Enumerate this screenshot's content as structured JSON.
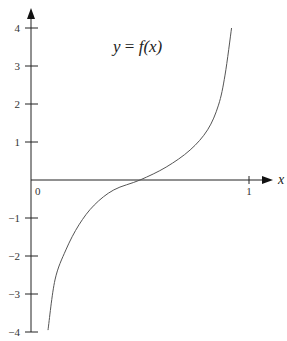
{
  "chart_data": {
    "type": "line",
    "title": "y = f(x)",
    "title_parts": {
      "y": "y",
      "eq": " = ",
      "f": "f",
      "arg": "(x)"
    },
    "xlabel": "x",
    "ylabel": "",
    "xlim": [
      0,
      1.05
    ],
    "ylim": [
      -4,
      4
    ],
    "grid": false,
    "legend": "none",
    "x_ticks": [
      {
        "value": 1,
        "label": "1"
      }
    ],
    "origin_label": "0",
    "y_ticks": [
      {
        "value": 4,
        "label": "4"
      },
      {
        "value": 3,
        "label": "3"
      },
      {
        "value": 2,
        "label": "2"
      },
      {
        "value": 1,
        "label": "1"
      },
      {
        "value": -1,
        "label": "−1"
      },
      {
        "value": -2,
        "label": "−2"
      },
      {
        "value": -3,
        "label": "−3"
      },
      {
        "value": -4,
        "label": "−4"
      }
    ],
    "series": [
      {
        "name": "f(x)",
        "x": [
          0.078,
          0.11,
          0.16,
          0.22,
          0.29,
          0.38,
          0.5,
          0.62,
          0.73,
          0.81,
          0.86,
          0.89,
          0.92
        ],
        "y": [
          -3.95,
          -2.63,
          -1.84,
          -1.18,
          -0.66,
          -0.26,
          0.0,
          0.34,
          0.79,
          1.32,
          1.97,
          2.76,
          4.0
        ]
      }
    ]
  },
  "colors": {
    "axis": "#222222",
    "curve": "#555555",
    "background": "#ffffff"
  }
}
